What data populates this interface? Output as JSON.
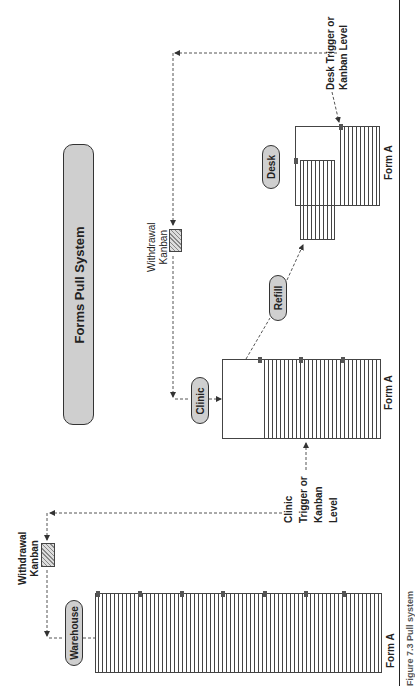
{
  "title": "Forms Pull System",
  "nodes": {
    "warehouse": "Warehouse",
    "clinic": "Clinic",
    "refill": "Refill",
    "desk": "Desk"
  },
  "kanban_labels": {
    "warehouse_withdrawal": [
      "Withdrawal",
      "Kanban"
    ],
    "clinic_withdrawal": [
      "Withdrawal",
      "Kanban"
    ]
  },
  "trigger_labels": {
    "clinic": [
      "Clinic",
      "Trigger or",
      "Kanban",
      "Level"
    ],
    "desk": [
      "Desk Trigger or",
      "Kanban Level"
    ]
  },
  "stack_labels": {
    "warehouse": "Form A",
    "clinic": "Form A",
    "desk": "Form A"
  },
  "caption": "Figure 7.3 Pull system",
  "colors": {
    "pill_fill": "#cfcfcf",
    "line": "#444444",
    "marker": "#555555"
  }
}
